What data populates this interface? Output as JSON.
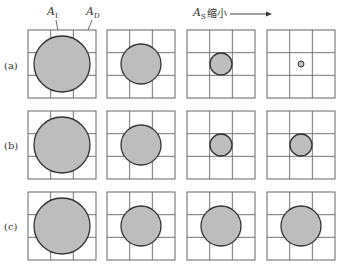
{
  "figure": {
    "annotations": {
      "inner_area": "A",
      "inner_area_sub": "I",
      "domain_area": "A",
      "domain_area_sub": "D",
      "shrink_label": "A",
      "shrink_label_sub": "S",
      "shrink_text": "缩小"
    },
    "rows": [
      {
        "label": "(a)",
        "radii": [
          28,
          20,
          11,
          3
        ]
      },
      {
        "label": "(b)",
        "radii": [
          28,
          20,
          11,
          11
        ]
      },
      {
        "label": "(c)",
        "radii": [
          28,
          20,
          20,
          20
        ]
      }
    ],
    "colors": {
      "circle_fill": "#bdbdbd",
      "circle_stroke": "#333333",
      "grid_stroke": "#666666"
    }
  }
}
